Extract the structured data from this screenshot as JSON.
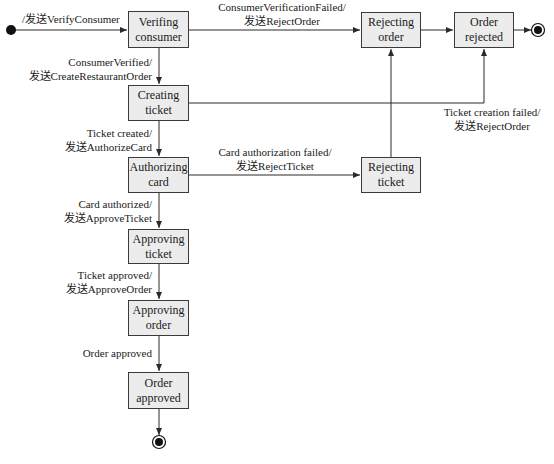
{
  "diagram": {
    "type": "state-machine",
    "colors": {
      "state_fill": "#ececec",
      "state_border": "#3a3a3a",
      "line": "#2a2a2a"
    },
    "states": {
      "verifying_consumer": {
        "line1": "Verifing",
        "line2": "consumer"
      },
      "creating_ticket": {
        "line1": "Creating",
        "line2": "ticket"
      },
      "authorizing_card": {
        "line1": "Authorizing",
        "line2": "card"
      },
      "approving_ticket": {
        "line1": "Approving",
        "line2": "ticket"
      },
      "approving_order": {
        "line1": "Approving",
        "line2": "order"
      },
      "order_approved": {
        "line1": "Order",
        "line2": "approved"
      },
      "rejecting_order": {
        "line1": "Rejecting",
        "line2": "order"
      },
      "order_rejected": {
        "line1": "Order",
        "line2": "rejected"
      },
      "rejecting_ticket": {
        "line1": "Rejecting",
        "line2": "ticket"
      }
    },
    "transitions": {
      "start": {
        "line1": "/发送VerifyConsumer"
      },
      "consumer_verification_failed": {
        "line1": "ConsumerVerificationFailed/",
        "line2": "发送RejectOrder"
      },
      "consumer_verified": {
        "line1": "ConsumerVerified/",
        "line2": "发送CreateRestaurantOrder"
      },
      "ticket_creation_failed": {
        "line1": "Ticket creation failed/",
        "line2": "发送RejectOrder"
      },
      "ticket_created": {
        "line1": "Ticket created/",
        "line2": "发送AuthorizeCard"
      },
      "card_authorization_failed": {
        "line1": "Card authorization failed/",
        "line2": "发送RejectTicket"
      },
      "card_authorized": {
        "line1": "Card authorized/",
        "line2": "发送ApproveTicket"
      },
      "ticket_approved": {
        "line1": "Ticket approved/",
        "line2": "发送ApproveOrder"
      },
      "order_approved": {
        "line1": "Order approved"
      }
    }
  }
}
